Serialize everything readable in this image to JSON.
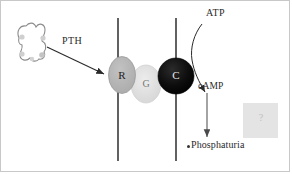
{
  "figure": {
    "background_color": "#ffffff",
    "border_color": "#c8c8c8",
    "width": 292,
    "height": 174
  },
  "labels": {
    "pth": "PTH",
    "atp": "ATP",
    "camp": "cAMP",
    "phosphaturia": "Phosphaturia",
    "receptor": "R",
    "gprotein": "G",
    "catalytic": "C",
    "unknown": "?"
  },
  "components": {
    "hormone": {
      "name": "PTH hormone molecule",
      "outline_color": "#8a8a8a",
      "dot_color": "#c9c9c9"
    },
    "membrane": {
      "name": "cell membrane bilayer",
      "line_color": "#3a3a3a",
      "left_x": 118,
      "right_x": 176,
      "top_y": 18,
      "bottom_y": 161
    },
    "receptor_oval": {
      "fill": "#b4b4b4",
      "stroke": "#9a9a9a"
    },
    "gprotein_oval": {
      "fill": "#dcdcdc",
      "stroke": "#d0d0d0"
    },
    "catalytic_circle": {
      "fill": "#0a0a0a",
      "stroke": "#000000"
    },
    "unknown_box": {
      "fill": "#e4e4e4"
    }
  },
  "arrows": {
    "pth_to_receptor": {
      "label": "PTH binding arrow",
      "color": "#2a2a2a",
      "style": "straight"
    },
    "atp_to_catalytic": {
      "label": "ATP substrate arrow",
      "color": "#2a2a2a",
      "style": "curved"
    },
    "camp_to_phosphaturia": {
      "label": "cAMP effect arrow",
      "color": "#555555",
      "style": "straight-vertical"
    }
  }
}
